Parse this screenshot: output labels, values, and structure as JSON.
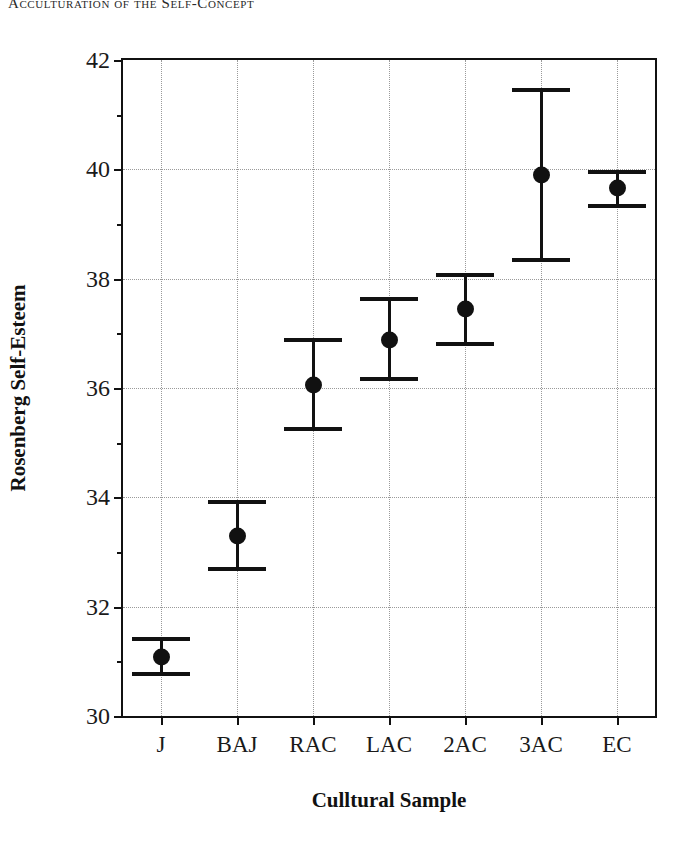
{
  "running_head": "Acculturation of the Self-Concept",
  "chart_data": {
    "type": "scatter",
    "title": "",
    "xlabel": "Culltural Sample",
    "ylabel": "Rosenberg Self-Esteem",
    "categories": [
      "J",
      "BAJ",
      "RAC",
      "LAC",
      "2AC",
      "3AC",
      "EC"
    ],
    "values": [
      31.08,
      33.3,
      36.05,
      36.88,
      37.45,
      39.9,
      39.65
    ],
    "error_upper": [
      31.4,
      33.92,
      36.87,
      37.62,
      38.07,
      41.45,
      39.95
    ],
    "error_lower": [
      30.77,
      32.68,
      35.25,
      36.17,
      36.8,
      38.35,
      39.33
    ],
    "ylim": [
      30,
      42
    ],
    "ytick_labels": [
      "30",
      "32",
      "34",
      "36",
      "38",
      "40",
      "42"
    ],
    "ytick_values": [
      30,
      32,
      34,
      36,
      38,
      40,
      42
    ],
    "yminor_ticks": [
      31,
      33,
      35,
      37,
      39,
      41
    ],
    "grid": "dotted",
    "legend": "none",
    "marker": "filled-circle",
    "errorbar_style": "capped"
  }
}
